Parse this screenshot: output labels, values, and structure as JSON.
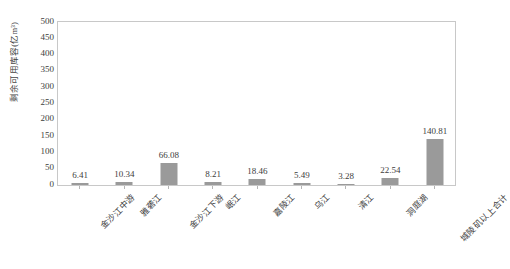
{
  "chart_data": {
    "type": "bar",
    "title": "",
    "xlabel": "",
    "ylabel": "剩余可用库容(亿m³)",
    "ylim": [
      0,
      500
    ],
    "ytick_step": 50,
    "grid": false,
    "legend": "none",
    "bar_color": "#9a9a9a",
    "plot_border_color": "#c8c8c8",
    "categories": [
      "金沙江中游",
      "雅砻江",
      "金沙江下游",
      "岷江",
      "嘉陵江",
      "乌江",
      "清江",
      "洞庭湖",
      "城陵矶以上合计"
    ],
    "values": [
      6.41,
      10.34,
      66.08,
      8.21,
      18.46,
      5.49,
      3.28,
      22.54,
      140.81
    ],
    "value_labels": [
      "6.41",
      "10.34",
      "66.08",
      "8.21",
      "18.46",
      "5.49",
      "3.28",
      "22.54",
      "140.81"
    ],
    "ytick_labels": [
      "500",
      "450",
      "400",
      "350",
      "300",
      "250",
      "200",
      "150",
      "100",
      "50",
      "0"
    ],
    "ytick_values": [
      500,
      450,
      400,
      350,
      300,
      250,
      200,
      150,
      100,
      50,
      0
    ]
  }
}
